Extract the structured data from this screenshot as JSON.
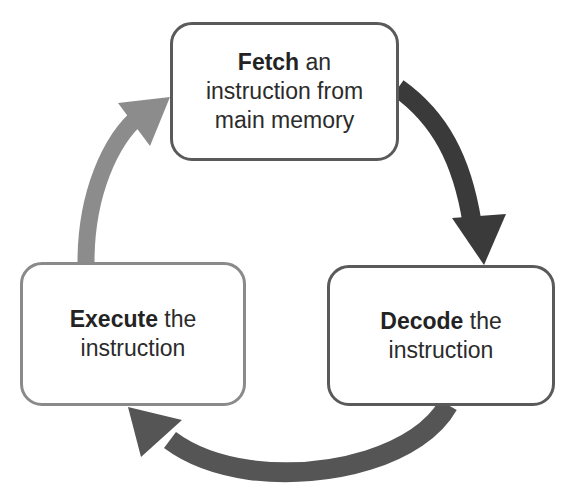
{
  "diagram": {
    "steps": [
      {
        "id": "fetch",
        "bold": "Fetch",
        "rest_line1": " an",
        "line2": "instruction from",
        "line3": "main memory"
      },
      {
        "id": "decode",
        "bold": "Decode",
        "rest_line1": " the",
        "line2": "instruction"
      },
      {
        "id": "execute",
        "bold": "Execute",
        "rest_line1": " the",
        "line2": "instruction"
      }
    ],
    "arrows": [
      {
        "from": "fetch",
        "to": "decode",
        "color": "#3a3a3a"
      },
      {
        "from": "decode",
        "to": "execute",
        "color": "#555555"
      },
      {
        "from": "execute",
        "to": "fetch",
        "color": "#8c8c8c"
      }
    ]
  }
}
